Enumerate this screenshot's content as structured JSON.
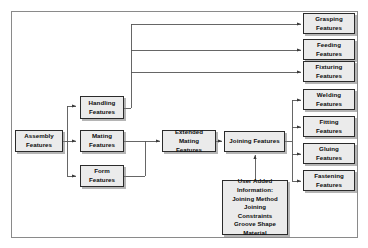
{
  "diagram": {
    "type": "flowchart",
    "colors": {
      "node_fill": "#ebebeb",
      "node_border": "#2b2b2b",
      "frame_border": "#8a8a8a",
      "wire": "#555555",
      "text": "#0d0d0d",
      "background": "#ffffff"
    },
    "nodes": {
      "assembly": "Assembly\nFeatures",
      "handling": "Handling\nFeatures",
      "mating": "Mating\nFeatures",
      "form": "Form\nFeatures",
      "extended_mating": "Extended Mating\nFeatures",
      "joining": "Joining Features",
      "user_added": "User Added\nInformation:\nJoining Method\nJoining\nConstraints\nGroove Shape\nMaterial",
      "grasping": "Grasping\nFeatures",
      "feeding": "Feeding\nFeatures",
      "fixturing": "Fixturing\nFeatures",
      "welding": "Welding\nFeatures",
      "fitting": "Fitting\nFeatures",
      "gluing": "Gluing\nFeatures",
      "fastening": "Fastening\nFeatures"
    },
    "edges": [
      {
        "from": "assembly",
        "to": "handling"
      },
      {
        "from": "assembly",
        "to": "mating"
      },
      {
        "from": "assembly",
        "to": "form"
      },
      {
        "from": "handling",
        "to": "grasping"
      },
      {
        "from": "handling",
        "to": "feeding"
      },
      {
        "from": "handling",
        "to": "fixturing"
      },
      {
        "from": "mating",
        "to": "extended_mating"
      },
      {
        "from": "form",
        "to": "extended_mating"
      },
      {
        "from": "extended_mating",
        "to": "joining"
      },
      {
        "from": "user_added",
        "to": "joining"
      },
      {
        "from": "joining",
        "to": "welding"
      },
      {
        "from": "joining",
        "to": "fitting"
      },
      {
        "from": "joining",
        "to": "gluing"
      },
      {
        "from": "joining",
        "to": "fastening"
      }
    ]
  }
}
